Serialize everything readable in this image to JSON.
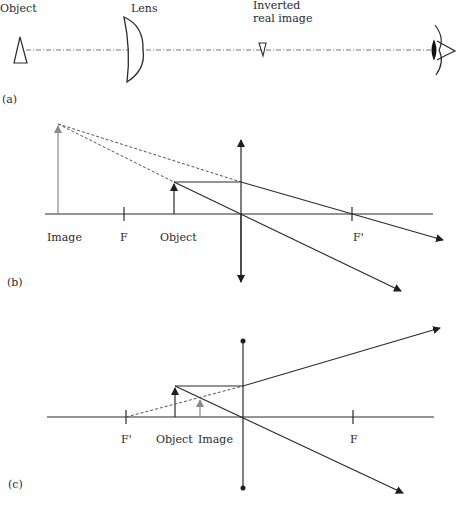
{
  "panel_a": {
    "label": "(a)",
    "object_label": "Object",
    "lens_label": "Lens",
    "image_label_line1": "Inverted",
    "image_label_line2": "real image"
  },
  "panel_b": {
    "label": "(b)",
    "image_label": "Image",
    "focal_left_label": "F",
    "object_label": "Object",
    "focal_right_label": "F'"
  },
  "panel_c": {
    "label": "(c)",
    "focal_left_label": "F'",
    "object_label": "Object",
    "image_label": "Image",
    "focal_right_label": "F"
  },
  "colors": {
    "line": "#2b2b2b",
    "image_arrow": "#8a8a8a",
    "background": "#ffffff"
  }
}
